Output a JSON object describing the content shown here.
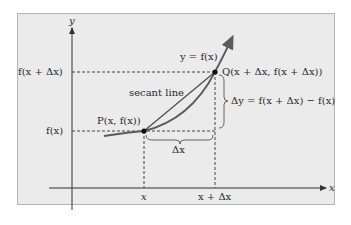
{
  "diagram": {
    "axes": {
      "x_label": "x",
      "y_label": "y"
    },
    "curve_label": "y = f(x)",
    "secant_label": "secant line",
    "points": {
      "P": "P(x, f(x))",
      "Q": "Q(x + Δx,  f(x + Δx))"
    },
    "y_ticks": {
      "upper": "f(x + Δx)",
      "lower": "f(x)"
    },
    "x_ticks": {
      "left": "x",
      "right": "x + Δx"
    },
    "delta_x_label": "Δx",
    "delta_y_label": "Δy = f(x + Δx) − f(x)",
    "colors": {
      "background": "#ebebeb",
      "curve": "#5a5a5a",
      "axis": "#333333",
      "point": "#111111",
      "dashed": "#444444",
      "text": "#2a2a2a"
    }
  }
}
